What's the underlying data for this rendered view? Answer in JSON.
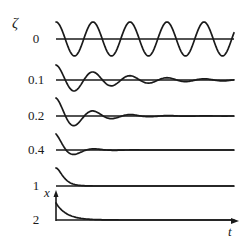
{
  "chart_data": {
    "type": "line",
    "title": "",
    "param_label": "ζ",
    "xlabel": "t",
    "ylabel": "x",
    "series": [
      {
        "name": "0",
        "zeta": 0,
        "label": "0",
        "baseline_y": 39,
        "amplitude": 17
      },
      {
        "name": "0.1",
        "zeta": 0.1,
        "label": "0.1",
        "baseline_y": 80,
        "amplitude": 15
      },
      {
        "name": "0.2",
        "zeta": 0.2,
        "label": "0.2",
        "baseline_y": 116,
        "amplitude": 18
      },
      {
        "name": "0.4",
        "zeta": 0.4,
        "label": "0.4",
        "baseline_y": 150,
        "amplitude": 16
      },
      {
        "name": "1",
        "zeta": 1,
        "label": "1",
        "baseline_y": 186,
        "amplitude": 18
      },
      {
        "name": "2",
        "zeta": 2,
        "label": "2",
        "baseline_y": 220,
        "amplitude": 17
      }
    ],
    "layout": {
      "x_start": 56,
      "x_end": 234,
      "period_px": 37,
      "grid": false,
      "legend": "none"
    }
  },
  "labels": {
    "zeta_symbol": "ζ",
    "x_axis": "x",
    "t_axis": "t"
  }
}
